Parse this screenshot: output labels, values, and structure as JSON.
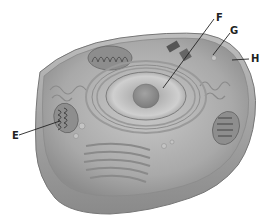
{
  "diagram": {
    "labels": [
      {
        "id": "E",
        "text": "E",
        "x": 12,
        "y": 131
      },
      {
        "id": "F",
        "text": "F",
        "x": 216,
        "y": 13
      },
      {
        "id": "G",
        "text": "G",
        "x": 230,
        "y": 26
      },
      {
        "id": "H",
        "text": "H",
        "x": 251,
        "y": 54
      }
    ]
  }
}
